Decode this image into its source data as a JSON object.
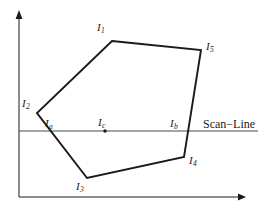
{
  "figure": {
    "type": "geometry-diagram",
    "background_color": "#ffffff",
    "stroke_color": "#1a1a1a",
    "axes": {
      "x_axis": {
        "name": "x-axis",
        "from": [
          19,
          197
        ],
        "to": [
          244,
          197
        ],
        "arrow": "right"
      },
      "y_axis": {
        "name": "y-axis",
        "from": [
          19,
          197
        ],
        "to": [
          19,
          12
        ],
        "arrow": "up"
      }
    },
    "polygon": {
      "name": "polygon",
      "vertices": [
        {
          "id": "I1",
          "label": "I",
          "sub": "1",
          "x": 112,
          "y": 41,
          "label_x": 97,
          "label_y": 22
        },
        {
          "id": "I5",
          "label": "I",
          "sub": "5",
          "x": 201,
          "y": 50,
          "label_x": 206,
          "label_y": 41
        },
        {
          "id": "I4",
          "label": "I",
          "sub": "4",
          "x": 184,
          "y": 157,
          "label_x": 189,
          "label_y": 155
        },
        {
          "id": "I3",
          "label": "I",
          "sub": "3",
          "x": 87,
          "y": 178,
          "label_x": 76,
          "label_y": 181
        },
        {
          "id": "I2",
          "label": "I",
          "sub": "2",
          "x": 37,
          "y": 113,
          "label_x": 22,
          "label_y": 98
        }
      ],
      "points_attr": "112,41 201,50 184,157 87,178 37,113"
    },
    "scan_line": {
      "name": "scan-line",
      "y": 131,
      "from_x": 19,
      "to_x": 258,
      "label": "Scan−Line",
      "label_x": 203,
      "label_y": 118
    },
    "intersections": [
      {
        "id": "Ia",
        "label": "I",
        "sub": "a",
        "x": 43,
        "y": 131,
        "label_x": 45,
        "label_y": 118
      },
      {
        "id": "Ib",
        "label": "I",
        "sub": "b",
        "x": 186,
        "y": 131,
        "label_x": 170,
        "label_y": 118
      }
    ],
    "interior_point": {
      "id": "Ic",
      "label": "I",
      "sub": "c",
      "x": 105,
      "y": 131,
      "r": 1.6,
      "label_x": 98,
      "label_y": 117
    }
  }
}
